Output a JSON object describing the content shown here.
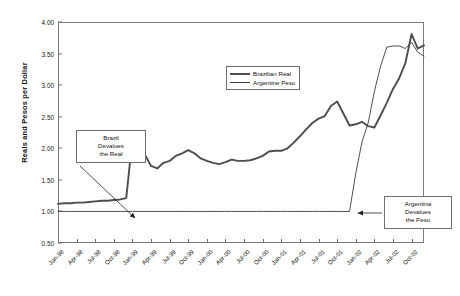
{
  "chart_data": {
    "type": "line",
    "title": "",
    "xlabel": "",
    "ylabel": "Reals and Pesos per Dollar",
    "ylim": [
      0.5,
      4.0
    ],
    "yticks": [
      "0.50",
      "1.00",
      "1.50",
      "2.00",
      "2.50",
      "3.00",
      "3.50",
      "4.00"
    ],
    "ytick_values": [
      0.5,
      1.0,
      1.5,
      2.0,
      2.5,
      3.0,
      3.5,
      4.0
    ],
    "grid": false,
    "legend_position": "upper-center",
    "xtick_labels": [
      "Jan-98",
      "Apr-98",
      "Jul-98",
      "Oct-98",
      "Jan-99",
      "Apr-99",
      "Jul-99",
      "Oct-99",
      "Jan-00",
      "Apr-00",
      "Jul-00",
      "Oct-00",
      "Jan-01",
      "Apr-01",
      "Jul-01",
      "Oct-01",
      "Jan-02",
      "Apr-02",
      "Jul-02",
      "Oct-02"
    ],
    "x_months": [
      "Jan-98",
      "Feb-98",
      "Mar-98",
      "Apr-98",
      "May-98",
      "Jun-98",
      "Jul-98",
      "Aug-98",
      "Sep-98",
      "Oct-98",
      "Nov-98",
      "Dec-98",
      "Jan-99",
      "Feb-99",
      "Mar-99",
      "Apr-99",
      "May-99",
      "Jun-99",
      "Jul-99",
      "Aug-99",
      "Sep-99",
      "Oct-99",
      "Nov-99",
      "Dec-99",
      "Jan-00",
      "Feb-00",
      "Mar-00",
      "Apr-00",
      "May-00",
      "Jun-00",
      "Jul-00",
      "Aug-00",
      "Sep-00",
      "Oct-00",
      "Nov-00",
      "Dec-00",
      "Jan-01",
      "Feb-01",
      "Mar-01",
      "Apr-01",
      "May-01",
      "Jun-01",
      "Jul-01",
      "Aug-01",
      "Sep-01",
      "Oct-01",
      "Nov-01",
      "Dec-01",
      "Jan-02",
      "Feb-02",
      "Mar-02",
      "Apr-02",
      "May-02",
      "Jun-02",
      "Jul-02",
      "Aug-02",
      "Sep-02",
      "Oct-02",
      "Nov-02",
      "Dec-02"
    ],
    "series": [
      {
        "name": "Brazilian Real",
        "color": "#4d4d4d",
        "width": 1.9,
        "values": [
          1.12,
          1.13,
          1.13,
          1.14,
          1.14,
          1.15,
          1.16,
          1.17,
          1.17,
          1.18,
          1.19,
          1.21,
          2.15,
          2.06,
          1.9,
          1.72,
          1.68,
          1.77,
          1.8,
          1.88,
          1.92,
          1.97,
          1.92,
          1.84,
          1.8,
          1.77,
          1.75,
          1.78,
          1.82,
          1.8,
          1.8,
          1.81,
          1.84,
          1.88,
          1.95,
          1.96,
          1.96,
          2.0,
          2.09,
          2.19,
          2.3,
          2.4,
          2.47,
          2.51,
          2.67,
          2.74,
          2.55,
          2.36,
          2.38,
          2.42,
          2.35,
          2.33,
          2.52,
          2.72,
          2.94,
          3.11,
          3.35,
          3.81,
          3.58,
          3.63
        ],
        "segments": [
          {
            "note": "pre-devaluation crawling peg 1.12 -> 1.21",
            "range": [
              "Jan-98",
              "Dec-98"
            ]
          },
          {
            "note": "float: jump to 2.15 in Jan-99",
            "range": [
              "Jan-99",
              "Jan-99"
            ]
          },
          {
            "note": "gradual depreciation and 2002 crisis run-up to 3.81",
            "range": [
              "Feb-99",
              "Dec-02"
            ]
          }
        ]
      },
      {
        "name": "Argentine Peso",
        "color": "#3a3a3a",
        "width": 0.9,
        "values": [
          1.0,
          1.0,
          1.0,
          1.0,
          1.0,
          1.0,
          1.0,
          1.0,
          1.0,
          1.0,
          1.0,
          1.0,
          1.0,
          1.0,
          1.0,
          1.0,
          1.0,
          1.0,
          1.0,
          1.0,
          1.0,
          1.0,
          1.0,
          1.0,
          1.0,
          1.0,
          1.0,
          1.0,
          1.0,
          1.0,
          1.0,
          1.0,
          1.0,
          1.0,
          1.0,
          1.0,
          1.0,
          1.0,
          1.0,
          1.0,
          1.0,
          1.0,
          1.0,
          1.0,
          1.0,
          1.0,
          1.0,
          1.0,
          1.6,
          2.1,
          2.4,
          2.9,
          3.3,
          3.6,
          3.62,
          3.62,
          3.58,
          3.68,
          3.52,
          3.46
        ],
        "segments": [
          {
            "note": "convertibility peg at 1.00 per dollar",
            "range": [
              "Jan-98",
              "Dec-01"
            ]
          },
          {
            "note": "devaluation and float from Jan-02",
            "range": [
              "Jan-02",
              "Dec-02"
            ]
          }
        ]
      }
    ],
    "annotations": [
      {
        "id": "brazil",
        "text_lines": [
          "Brazil",
          "Devalues",
          "the Real"
        ],
        "points_to": "Jan-99 Brazilian Real devaluation",
        "leader": "diagonal-arrow-down-right"
      },
      {
        "id": "argentina",
        "text_lines": [
          "Argentina",
          "Devalues",
          "the Peso"
        ],
        "points_to": "Jan-02 Argentine Peso devaluation",
        "leader": "horizontal-arrow-left"
      }
    ]
  },
  "axis": {
    "y_title": "Reals and Pesos per Dollar"
  },
  "legend": {
    "entries": [
      {
        "label": "Brazilian Real"
      },
      {
        "label": "Argentine Peso"
      }
    ]
  },
  "callouts": {
    "brazil": {
      "line1": "Brazil",
      "line2": "Devalues",
      "line3": "the Real"
    },
    "argentina": {
      "line1": "Argentina",
      "line2": "Devalues",
      "line3": "the Peso"
    }
  },
  "colors": {
    "real": "#4d4d4d",
    "peso": "#3a3a3a",
    "frame": "#7a7a7a",
    "background": "#ffffff"
  }
}
